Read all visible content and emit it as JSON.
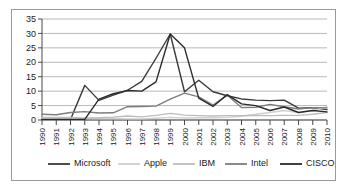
{
  "chart_data": {
    "type": "line",
    "title": "",
    "xlabel": "",
    "ylabel": "",
    "ylim": [
      0,
      35
    ],
    "ytick_step": 5,
    "yticks": [
      0,
      5,
      10,
      15,
      20,
      25,
      30,
      35
    ],
    "grid": true,
    "legend_position": "bottom",
    "categories": [
      "1990",
      "1991",
      "1992",
      "1993",
      "1994",
      "1995",
      "1996",
      "1997",
      "1998",
      "1999",
      "2000",
      "2001",
      "2002",
      "2003",
      "2004",
      "2005",
      "2006",
      "2007",
      "2008",
      "2009",
      "2010"
    ],
    "series": [
      {
        "name": "Microsoft",
        "color": "#3a3a3a",
        "values": [
          0.2,
          0.2,
          0.2,
          12.0,
          6.8,
          8.6,
          10.3,
          13.4,
          21.4,
          29.8,
          9.8,
          13.8,
          9.8,
          8.4,
          7.3,
          6.9,
          6.7,
          6.9,
          4.1,
          4.3,
          3.6
        ]
      },
      {
        "name": "Apple",
        "color": "#d0d0d0",
        "values": [
          0.6,
          0.7,
          0.8,
          0.6,
          0.5,
          0.5,
          0.4,
          0.4,
          0.6,
          0.9,
          0.7,
          0.8,
          0.8,
          0.9,
          1.3,
          2.0,
          2.6,
          3.3,
          2.6,
          3.3,
          4.6
        ]
      },
      {
        "name": "IBM",
        "color": "#bdbdbd",
        "values": [
          0.9,
          0.9,
          0.9,
          0.6,
          0.8,
          1.0,
          1.4,
          1.1,
          1.6,
          2.3,
          1.7,
          1.5,
          1.4,
          1.5,
          1.5,
          1.6,
          1.5,
          1.6,
          1.6,
          2.0,
          2.6
        ]
      },
      {
        "name": "Intel",
        "color": "#7d7d7d",
        "values": [
          2.0,
          1.8,
          2.6,
          2.9,
          2.4,
          2.5,
          4.6,
          4.7,
          4.8,
          7.2,
          9.3,
          8.0,
          5.2,
          8.6,
          4.3,
          4.4,
          5.4,
          4.6,
          3.8,
          4.3,
          4.2
        ]
      },
      {
        "name": "CISCO",
        "color": "#2b2b2b",
        "values": [
          0.2,
          0.2,
          0.2,
          0.2,
          7.2,
          9.1,
          10.2,
          10.0,
          13.2,
          29.8,
          25.0,
          7.6,
          4.7,
          8.8,
          5.6,
          5.0,
          3.3,
          4.5,
          2.6,
          3.3,
          2.8
        ]
      }
    ]
  },
  "legend": {
    "entries": [
      {
        "label": "Microsoft"
      },
      {
        "label": "Apple"
      },
      {
        "label": "IBM"
      },
      {
        "label": "Intel"
      },
      {
        "label": "CISCO"
      }
    ]
  }
}
